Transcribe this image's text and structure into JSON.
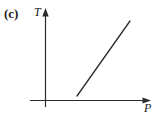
{
  "figure": {
    "panel_label": "(c)",
    "background_color": "#ffffff",
    "ink_color": "#2b2b2b"
  },
  "chart_data": {
    "type": "line",
    "title": "",
    "subtitle": "",
    "panel": "(c)",
    "xlabel": "P",
    "ylabel": "T",
    "xlabel_style": "italic",
    "ylabel_style": "italic",
    "grid": false,
    "legend": null,
    "ticks": {
      "x": [],
      "y": []
    },
    "axes": {
      "x_arrow": true,
      "y_arrow": true,
      "origin_shown": true,
      "xlim": [
        0,
        1
      ],
      "ylim": [
        0,
        1
      ]
    },
    "series": [
      {
        "name": "T vs P",
        "description": "straight line of positive slope, not passing through the origin",
        "x": [
          0.305,
          0.81
        ],
        "y": [
          0.043,
          0.815
        ],
        "color": "#2b2b2b",
        "linewidth": 1.3,
        "style": "solid"
      }
    ],
    "annotations": []
  },
  "geometry": {
    "y_axis": {
      "x": 45.5,
      "y_top": 9,
      "y_bottom": 107
    },
    "x_axis": {
      "y": 100.5,
      "x_left": 30,
      "x_right": 150
    },
    "data_line": {
      "x1": 77,
      "y1": 96,
      "x2": 130,
      "y2": 21
    }
  }
}
